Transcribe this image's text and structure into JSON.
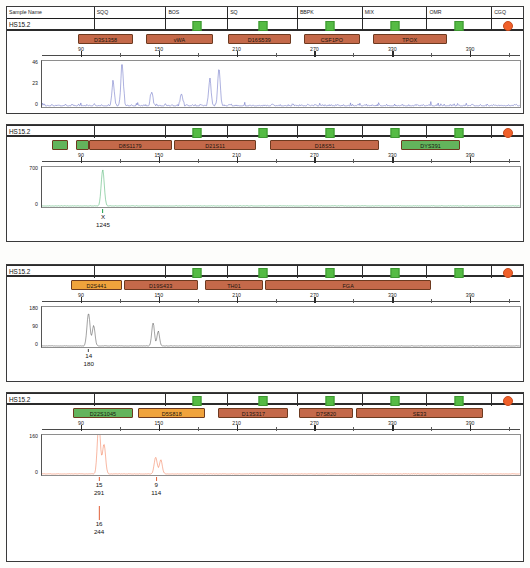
{
  "colors": {
    "panel1_trace": "#4a54b8",
    "panel2_trace": "#1e9e4a",
    "panel3_trace": "#2b2b2b",
    "panel4_trace": "#ef5a2a",
    "locus_brown": "#c4694a",
    "locus_orange": "#f0a33c",
    "locus_green": "#63b45c",
    "marker_green": "#55bb44",
    "marker_orange": "#f0602a",
    "grid": "#8e8e8e"
  },
  "table_header": {
    "columns": [
      "Sample Name",
      "SQQ",
      "BOS",
      "SQ",
      "BBPK",
      "MIX",
      "OMR",
      "CGQ"
    ]
  },
  "axis": {
    "ticks": [
      90,
      150,
      210,
      270,
      330,
      390
    ],
    "min": 60,
    "max": 430
  },
  "panels": [
    {
      "id": "panel-1",
      "sample_name": "HS15.2",
      "dye_color": "#4a54b8",
      "y_labels": [
        "46",
        "23",
        "0"
      ],
      "y_max": 46,
      "loci": [
        {
          "name": "D3S1358",
          "start": 88,
          "end": 130,
          "color": "#c4694a"
        },
        {
          "name": "vWA",
          "start": 140,
          "end": 192,
          "color": "#c4694a"
        },
        {
          "name": "D16S539",
          "start": 203,
          "end": 252,
          "color": "#c4694a"
        },
        {
          "name": "CSF1PO",
          "start": 262,
          "end": 305,
          "color": "#c4694a"
        },
        {
          "name": "TPOX",
          "start": 315,
          "end": 372,
          "color": "#c4694a"
        }
      ],
      "calls": []
    },
    {
      "id": "panel-2",
      "sample_name": "HS15.2",
      "dye_color": "#1e9e4a",
      "y_labels": [
        "700",
        "0"
      ],
      "y_max": 1400,
      "loci": [
        {
          "name": "",
          "start": 68,
          "end": 80,
          "color": "#63b45c"
        },
        {
          "name": "",
          "start": 86,
          "end": 96,
          "color": "#63b45c"
        },
        {
          "name": "D8S1179",
          "start": 96,
          "end": 160,
          "color": "#c4694a"
        },
        {
          "name": "D21S11",
          "start": 162,
          "end": 225,
          "color": "#c4694a"
        },
        {
          "name": "D18S51",
          "start": 236,
          "end": 320,
          "color": "#c4694a"
        },
        {
          "name": "DYS391",
          "start": 337,
          "end": 382,
          "color": "#63b45c"
        }
      ],
      "calls": [
        {
          "allele": "X",
          "size": "1245",
          "pos": 107,
          "level": 1
        }
      ]
    },
    {
      "id": "panel-3",
      "sample_name": "HS15.2",
      "dye_color": "#2b2b2b",
      "y_labels": [
        "180",
        "90",
        "0"
      ],
      "y_max": 180,
      "loci": [
        {
          "name": "D2S441",
          "start": 82,
          "end": 122,
          "color": "#f0a33c"
        },
        {
          "name": "D19S433",
          "start": 123,
          "end": 180,
          "color": "#c4694a"
        },
        {
          "name": "TH01",
          "start": 186,
          "end": 230,
          "color": "#c4694a"
        },
        {
          "name": "FGA",
          "start": 232,
          "end": 360,
          "color": "#c4694a"
        }
      ],
      "calls": [
        {
          "allele": "14",
          "size": "180",
          "pos": 96,
          "level": 1
        }
      ]
    },
    {
      "id": "panel-4",
      "sample_name": "HS15.2",
      "dye_color": "#ef5a2a",
      "y_labels": [
        "160",
        "0"
      ],
      "y_max": 320,
      "loci": [
        {
          "name": "D22S1045",
          "start": 84,
          "end": 130,
          "color": "#63b45c"
        },
        {
          "name": "D5S818",
          "start": 134,
          "end": 186,
          "color": "#f0a33c"
        },
        {
          "name": "D13S317",
          "start": 196,
          "end": 250,
          "color": "#c4694a"
        },
        {
          "name": "D7S820",
          "start": 258,
          "end": 300,
          "color": "#c4694a"
        },
        {
          "name": "SE33",
          "start": 302,
          "end": 400,
          "color": "#c4694a"
        }
      ],
      "calls": [
        {
          "allele": "15",
          "size": "291",
          "pos": 104,
          "level": 1
        },
        {
          "allele": "9",
          "size": "114",
          "pos": 148,
          "level": 1
        },
        {
          "allele": "16",
          "size": "244",
          "pos": 104,
          "level": 2
        }
      ]
    }
  ]
}
